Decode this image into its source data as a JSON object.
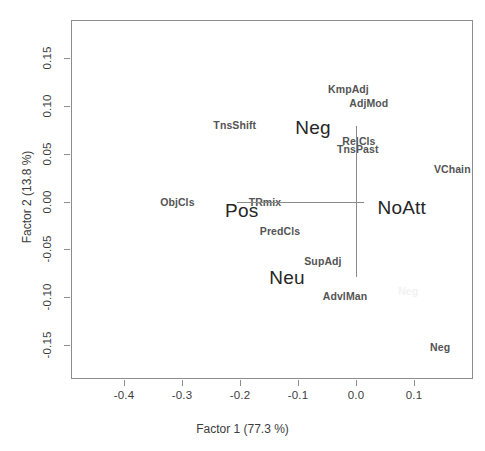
{
  "chart_data": {
    "type": "scatter",
    "title": "",
    "xlabel": "Factor 1  (77.3 %)",
    "ylabel": "Factor 2  (13.8 %)",
    "xlim": [
      -0.468,
      0.225
    ],
    "ylim": [
      -0.188,
      0.188
    ],
    "xticks": [
      "-0.4",
      "-0.3",
      "-0.2",
      "-0.1",
      "0.0",
      "0.1"
    ],
    "xtick_values": [
      -0.4,
      -0.3,
      -0.2,
      -0.1,
      0.0,
      0.1
    ],
    "yticks": [
      "-0.15",
      "-0.10",
      "-0.05",
      "0.00",
      "0.05",
      "0.10",
      "0.15"
    ],
    "ytick_values": [
      -0.15,
      -0.1,
      -0.05,
      0.0,
      0.05,
      0.1,
      0.15
    ],
    "grid": false,
    "legend": "none",
    "origin_rules": {
      "horizontal": {
        "y": 0.0,
        "x_start": -0.206,
        "x_end": 0.014
      },
      "vertical": {
        "x": 0.0,
        "y_start": -0.079,
        "y_end": 0.079
      }
    },
    "points": [
      {
        "label": "KmpAdj",
        "x": -0.013,
        "y": 0.118,
        "style": "small"
      },
      {
        "label": "AdjMod",
        "x": 0.022,
        "y": 0.103,
        "style": "small"
      },
      {
        "label": "TnsShift",
        "x": -0.209,
        "y": 0.08,
        "style": "small"
      },
      {
        "label": "Neg",
        "x": -0.074,
        "y": 0.078,
        "style": "big"
      },
      {
        "label": "RelCls",
        "x": 0.005,
        "y": 0.063,
        "style": "small"
      },
      {
        "label": "TnsPast",
        "x": 0.003,
        "y": 0.055,
        "style": "small"
      },
      {
        "label": "VChain",
        "x": 0.166,
        "y": 0.034,
        "style": "small"
      },
      {
        "label": "ObjCls",
        "x": -0.308,
        "y": 0.0,
        "style": "small"
      },
      {
        "label": "TRmix",
        "x": -0.157,
        "y": 0.0,
        "style": "small"
      },
      {
        "label": "Pos",
        "x": -0.197,
        "y": -0.009,
        "style": "big"
      },
      {
        "label": "NoAtt",
        "x": 0.079,
        "y": -0.006,
        "style": "big"
      },
      {
        "label": "PredCls",
        "x": -0.131,
        "y": -0.031,
        "style": "small"
      },
      {
        "label": "SupAdj",
        "x": -0.057,
        "y": -0.062,
        "style": "small"
      },
      {
        "label": "Neu",
        "x": -0.119,
        "y": -0.079,
        "style": "big"
      },
      {
        "label": "AdvlMan",
        "x": -0.019,
        "y": -0.099,
        "style": "small"
      },
      {
        "label": "Neg",
        "x": 0.145,
        "y": -0.152,
        "style": "small"
      },
      {
        "label": "Neg",
        "x": 0.09,
        "y": -0.094,
        "style": "ghost"
      }
    ]
  },
  "colors": {
    "frame": "#8d8d8d",
    "axis_text": "#3c3c3c",
    "label_small": "#545454",
    "label_big": "#262626",
    "origin_rule": "#8a8a8a",
    "background": "#ffffff"
  }
}
